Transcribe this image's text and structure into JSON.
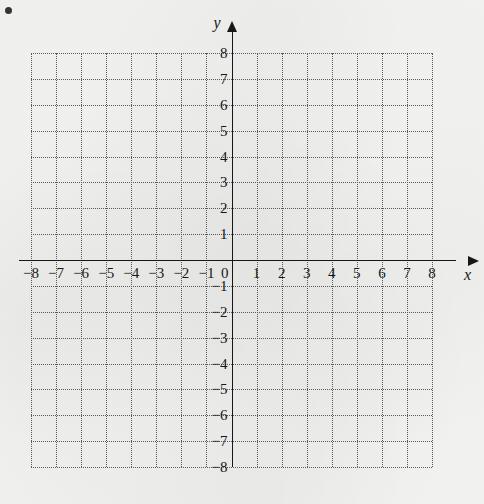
{
  "figure": {
    "type": "coordinate-grid",
    "marker": "bullet-point",
    "paper_color": "#f5f5f3",
    "ink_color": "#171717",
    "grid_color": "#5a5a5a"
  },
  "axes": {
    "x": {
      "name": "x",
      "arrow": "right",
      "min": -8,
      "max": 8,
      "step": 1,
      "labels": [
        "-8",
        "-7",
        "-6",
        "-5",
        "-4",
        "-3",
        "-2",
        "-1",
        "1",
        "2",
        "3",
        "4",
        "5",
        "6",
        "7",
        "8"
      ]
    },
    "y": {
      "name": "y",
      "arrow": "up",
      "min": -8,
      "max": 8,
      "step": 1,
      "labels": [
        "8",
        "7",
        "6",
        "5",
        "4",
        "3",
        "2",
        "1",
        "-1",
        "-2",
        "-3",
        "-4",
        "-5",
        "-6",
        "-7",
        "-8"
      ]
    },
    "origin_label": "0"
  },
  "chart_data": {
    "type": "scatter",
    "title": "",
    "subtitle": "",
    "xlabel": "x",
    "ylabel": "y",
    "xlim": [
      -8,
      8
    ],
    "ylim": [
      -8,
      8
    ],
    "xticks": [
      -8,
      -7,
      -6,
      -5,
      -4,
      -3,
      -2,
      -1,
      0,
      1,
      2,
      3,
      4,
      5,
      6,
      7,
      8
    ],
    "yticks": [
      -8,
      -7,
      -6,
      -5,
      -4,
      -3,
      -2,
      -1,
      0,
      1,
      2,
      3,
      4,
      5,
      6,
      7,
      8
    ],
    "xticklabels": [
      "-8",
      "-7",
      "-6",
      "-5",
      "-4",
      "-3",
      "-2",
      "-1",
      "0",
      "1",
      "2",
      "3",
      "4",
      "5",
      "6",
      "7",
      "8"
    ],
    "yticklabels": [
      "-8",
      "-7",
      "-6",
      "-5",
      "-4",
      "-3",
      "-2",
      "-1",
      "0",
      "1",
      "2",
      "3",
      "4",
      "5",
      "6",
      "7",
      "8"
    ],
    "grid": true,
    "grid_style": "dotted",
    "grid_spacing": 1,
    "legend": false,
    "series": [],
    "points": [],
    "annotations": [],
    "note": "Empty blank Cartesian coordinate plane for plotting; no data plotted."
  }
}
